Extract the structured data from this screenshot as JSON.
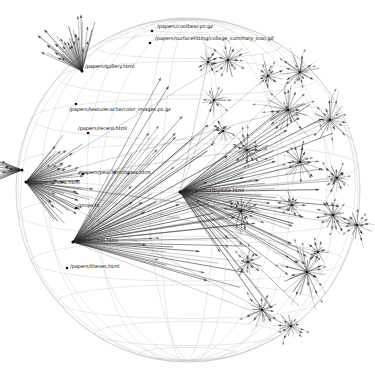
{
  "app": {
    "title": "H3 Hyperbolic Graph Viewer",
    "background_color": "#ffffff",
    "sphere_color": "#c8c8c8",
    "edge_color": "#303030",
    "node_color": "#101010",
    "label_color": "#101010"
  },
  "graph": {
    "layout": "hyperbolic-sphere",
    "projection": "poincare-ball",
    "description": "Website link-structure graph laid out in hyperbolic space, drawn inside a latitude/longitude wireframe sphere with directed arrow edges and star-burst sub-tree clusters.",
    "sphere": {
      "center_x": 188,
      "center_y": 190,
      "radius": 172,
      "latitude_lines": 11,
      "longitude_lines": 16
    },
    "labels": [
      {
        "id": "coolbear",
        "text": "/papers/coolbear.ps.gz",
        "x": 157,
        "y": 24,
        "node_x": 152,
        "node_y": 31
      },
      {
        "id": "collage",
        "text": "/papers/surfacefitting/collage_summary_icon.gif",
        "x": 155,
        "y": 36,
        "node_x": 150,
        "node_y": 43
      },
      {
        "id": "gallery",
        "text": "/papers/gallery.html",
        "x": 85,
        "y": 64,
        "node_x": 82,
        "node_y": 71
      },
      {
        "id": "colorimages",
        "text": "/papers/texturecache/color_images.ps.gz",
        "x": 69,
        "y": 107,
        "node_x": 76,
        "node_y": 104
      },
      {
        "id": "recent",
        "text": "/papers/recent.html",
        "x": 78,
        "y": 126,
        "node_x": 88,
        "node_y": 133
      },
      {
        "id": "yearindex",
        "text": "/papers/year.html/index.html",
        "x": 79,
        "y": 170,
        "node_x": 83,
        "node_y": 174
      },
      {
        "id": "index",
        "text": "/papers/index.html",
        "x": 33,
        "y": 180,
        "node_x": 26,
        "node_y": 182
      },
      {
        "id": "projects",
        "text": "/projects",
        "x": 78,
        "y": 203,
        "node_x": 76,
        "node_y": 208
      },
      {
        "id": "bib",
        "text": "/papers/bib.html",
        "x": 77,
        "y": 238,
        "node_x": 73,
        "node_y": 242
      },
      {
        "id": "theses",
        "text": "/papers/theses.html",
        "x": 70,
        "y": 264,
        "node_x": 67,
        "node_y": 268
      },
      {
        "id": "sortbydate",
        "text": "/papers/sortbydate.html",
        "x": 184,
        "y": 188,
        "node_x": 180,
        "node_y": 192
      }
    ],
    "hubs": [
      {
        "id": "hub-index",
        "x": 26,
        "y": 182,
        "rays": 46,
        "spread": 105,
        "dir": 0,
        "len": 64,
        "weight": 0.95
      },
      {
        "id": "hub-bib",
        "x": 73,
        "y": 242,
        "rays": 54,
        "spread": 78,
        "dir": -22,
        "len": 170,
        "weight": 1.0
      },
      {
        "id": "hub-sort",
        "x": 180,
        "y": 192,
        "rays": 52,
        "spread": 96,
        "dir": 8,
        "len": 150,
        "weight": 1.0
      },
      {
        "id": "hub-gallery",
        "x": 82,
        "y": 71,
        "rays": 34,
        "spread": 80,
        "dir": -115,
        "len": 52,
        "weight": 0.85
      },
      {
        "id": "hub-left",
        "x": 22,
        "y": 170,
        "rays": 22,
        "spread": 44,
        "dir": 180,
        "len": 30,
        "weight": 0.6
      }
    ],
    "clusters": [
      {
        "id": "c1",
        "x": 228,
        "y": 60,
        "rays": 20,
        "r": 16
      },
      {
        "id": "c2",
        "x": 268,
        "y": 76,
        "rays": 16,
        "r": 13
      },
      {
        "id": "c3",
        "x": 300,
        "y": 72,
        "rays": 22,
        "r": 17
      },
      {
        "id": "c4",
        "x": 288,
        "y": 110,
        "rays": 26,
        "r": 21
      },
      {
        "id": "c5",
        "x": 330,
        "y": 120,
        "rays": 24,
        "r": 19
      },
      {
        "id": "c6",
        "x": 214,
        "y": 100,
        "rays": 14,
        "r": 12
      },
      {
        "id": "c7",
        "x": 247,
        "y": 150,
        "rays": 20,
        "r": 15
      },
      {
        "id": "c8",
        "x": 300,
        "y": 162,
        "rays": 22,
        "r": 18
      },
      {
        "id": "c9",
        "x": 337,
        "y": 178,
        "rays": 18,
        "r": 15
      },
      {
        "id": "c10",
        "x": 241,
        "y": 211,
        "rays": 22,
        "r": 17
      },
      {
        "id": "c11",
        "x": 292,
        "y": 205,
        "rays": 16,
        "r": 13
      },
      {
        "id": "c12",
        "x": 333,
        "y": 215,
        "rays": 20,
        "r": 16
      },
      {
        "id": "c13",
        "x": 357,
        "y": 225,
        "rays": 16,
        "r": 14
      },
      {
        "id": "c14",
        "x": 248,
        "y": 262,
        "rays": 16,
        "r": 13
      },
      {
        "id": "c15",
        "x": 307,
        "y": 272,
        "rays": 28,
        "r": 23
      },
      {
        "id": "c16",
        "x": 262,
        "y": 310,
        "rays": 18,
        "r": 15
      },
      {
        "id": "c17",
        "x": 291,
        "y": 326,
        "rays": 16,
        "r": 13
      },
      {
        "id": "c18",
        "x": 208,
        "y": 62,
        "rays": 12,
        "r": 10
      },
      {
        "id": "c19",
        "x": 318,
        "y": 252,
        "rays": 12,
        "r": 10
      },
      {
        "id": "c20",
        "x": 223,
        "y": 131,
        "rays": 12,
        "r": 10
      }
    ]
  }
}
